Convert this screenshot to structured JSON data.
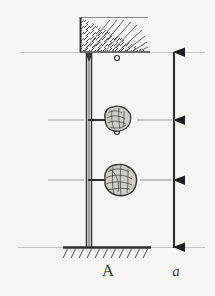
{
  "figure": {
    "kind": "hand-drawn engineering sketch",
    "background_color": "#f6f5f2",
    "ink_color": "#2e2e2c",
    "guideline_color": "#bfbcb6",
    "labels": {
      "column_label": "A",
      "diagram_label": "a"
    }
  },
  "geometry": {
    "width": 215,
    "height": 296,
    "ceiling_y": 52,
    "ground_y": 247,
    "column_x": 88,
    "column_width": 5,
    "rod_x": 117,
    "scale_line_x": 174,
    "level_upper_y": 120,
    "level_lower_y": 180
  },
  "elements": {
    "ceiling_support": {
      "name": "hatched-ceiling",
      "x": 79,
      "y": 16,
      "width": 68,
      "height": 36,
      "hatch_direction": "down-right"
    },
    "ground_support": {
      "name": "hatched-ground",
      "x": 63,
      "y": 247,
      "width": 88,
      "height": 11,
      "hatch_direction": "down-left"
    },
    "column": {
      "name": "vertical-column",
      "top_y": 52,
      "bottom_y": 247
    },
    "masses": [
      {
        "name": "upper-mass",
        "cx": 117,
        "cy": 120,
        "rx": 13,
        "ry": 11
      },
      {
        "name": "lower-mass",
        "cx": 120,
        "cy": 180,
        "rx": 16,
        "ry": 14
      }
    ],
    "rods": [
      {
        "name": "rod-ceiling-to-upper-mass",
        "x": 117,
        "y1": 58,
        "y2": 110
      },
      {
        "name": "rod-upper-to-lower-mass",
        "x": 117,
        "y1": 131,
        "y2": 168
      }
    ],
    "pin_joints": [
      {
        "name": "pin-joint",
        "cx": 117,
        "cy": 59
      },
      {
        "name": "pin-joint",
        "cx": 117,
        "cy": 109
      },
      {
        "name": "pin-joint",
        "cx": 117,
        "cy": 132
      },
      {
        "name": "pin-joint",
        "cx": 117,
        "cy": 167
      }
    ],
    "floor_connectors": [
      {
        "name": "floor-connector-upper",
        "x1": 90,
        "x2": 110,
        "y": 120
      },
      {
        "name": "floor-connector-lower",
        "x1": 90,
        "x2": 108,
        "y": 180
      }
    ],
    "guidelines": [
      {
        "name": "guideline-ceiling",
        "y": 52,
        "x1": 20,
        "x2": 205
      },
      {
        "name": "guideline-upper-level",
        "y": 120,
        "x1": 48,
        "x2": 88
      },
      {
        "name": "guideline-upper-level-right",
        "y": 120,
        "x1": 136,
        "x2": 176
      },
      {
        "name": "guideline-lower-level",
        "y": 180,
        "x1": 48,
        "x2": 90
      },
      {
        "name": "guideline-lower-level-right",
        "y": 180,
        "x1": 140,
        "x2": 176
      },
      {
        "name": "guideline-ground",
        "y": 247,
        "x1": 20,
        "x2": 205
      }
    ],
    "scale_arrows": [
      {
        "name": "arrowhead-top",
        "y": 52
      },
      {
        "name": "arrowhead-upper-level",
        "y": 120
      },
      {
        "name": "arrowhead-lower-level",
        "y": 180
      },
      {
        "name": "arrowhead-ground",
        "y": 247
      }
    ]
  }
}
